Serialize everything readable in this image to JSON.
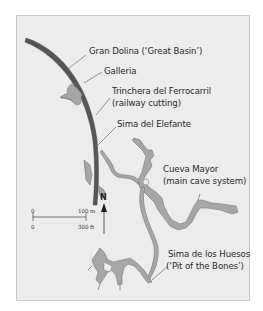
{
  "map": {
    "colors": {
      "background": "#ececec",
      "frame_border": "#c9c9c9",
      "cave_fill": "#a6a6a6",
      "cave_outline": "#7a7a7a",
      "railway_cutting": "#565656",
      "leader_line": "#555555",
      "text": "#2a2a2a"
    },
    "labels": {
      "gran_dolina": "Gran Dolina (‘Great Basin’)",
      "galleria": "Galleria",
      "trinchera_line1": "Trinchera del Ferrocarril",
      "trinchera_line2": "(railway cutting)",
      "sima_elefante": "Sima del Elefante",
      "cueva_mayor_line1": "Cueva Mayor",
      "cueva_mayor_line2": "(main cave system)",
      "sima_huesos_line1": "Sima de los Huesos",
      "sima_huesos_line2": "(‘Pit of the Bones’)"
    },
    "scale_bar": {
      "top_left": "0",
      "top_right": "100 m",
      "bottom_left": "0",
      "bottom_right": "300 ft"
    },
    "north_arrow": {
      "label": "N"
    }
  }
}
